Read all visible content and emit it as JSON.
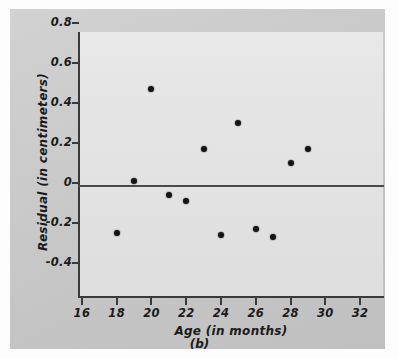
{
  "chart_data": {
    "type": "scatter",
    "title": "",
    "caption": "(b)",
    "xlabel": "Age (in months)",
    "ylabel": "Residual (in centimeters)",
    "xlim": [
      15.2,
      32.8
    ],
    "ylim": [
      -0.52,
      0.8
    ],
    "xticks": [
      16,
      18,
      20,
      22,
      24,
      26,
      28,
      30,
      32
    ],
    "xtick_labels": [
      "16",
      "18",
      "20",
      "22",
      "24",
      "26",
      "28",
      "30",
      "32"
    ],
    "yticks": [
      0.8,
      0.6,
      0.4,
      0.2,
      0,
      -0.2,
      -0.4
    ],
    "ytick_labels": [
      "0.8",
      "0.6",
      "0.4",
      "0.2",
      "0",
      "-0.2",
      "-0.4"
    ],
    "grid": false,
    "legend": null,
    "reference_line": {
      "name": "zero-residual-line",
      "y": 0
    },
    "marker": {
      "shape": "circle",
      "color": "#141414",
      "size": 6
    },
    "points": [
      {
        "x": 18,
        "y": -0.25
      },
      {
        "x": 19,
        "y": 0.01
      },
      {
        "x": 20,
        "y": 0.47
      },
      {
        "x": 21,
        "y": -0.06
      },
      {
        "x": 22,
        "y": -0.09
      },
      {
        "x": 23,
        "y": 0.17
      },
      {
        "x": 24,
        "y": -0.26
      },
      {
        "x": 25,
        "y": 0.3
      },
      {
        "x": 26,
        "y": -0.23
      },
      {
        "x": 27,
        "y": -0.27
      },
      {
        "x": 28,
        "y": 0.1
      },
      {
        "x": 29,
        "y": 0.17
      }
    ]
  },
  "colors": {
    "figure_background": "#fdfdfd",
    "card_background": "#c9c9c9",
    "panel_background": "#e4e4e4",
    "axis": "#3a3a3a",
    "marker": "#141414"
  }
}
